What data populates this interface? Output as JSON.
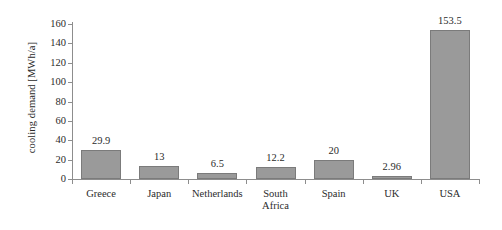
{
  "chart_data": {
    "type": "bar",
    "title": "",
    "xlabel": "",
    "ylabel": "cooling demand [MWh/a]",
    "ylim": [
      0,
      160
    ],
    "yticks": [
      0,
      20,
      40,
      60,
      80,
      100,
      120,
      140,
      160
    ],
    "grid": false,
    "legend": null,
    "bar_color": "#9a9a9a",
    "bar_border_color": "#7b7b7b",
    "axis_color": "#8d8d8d",
    "text_color": "#2b2b2b",
    "categories": [
      "Greece",
      "Japan",
      "Netherlands",
      "South\nAfrica",
      "Spain",
      "UK",
      "USA"
    ],
    "values": [
      29.9,
      13,
      6.5,
      12.2,
      20,
      2.96,
      153.5
    ],
    "value_labels": [
      "29.9",
      "13",
      "6.5",
      "12.2",
      "20",
      "2.96",
      "153.5"
    ],
    "tick_labels": [
      "0",
      "20",
      "40",
      "60",
      "80",
      "100",
      "120",
      "140",
      "160"
    ]
  }
}
